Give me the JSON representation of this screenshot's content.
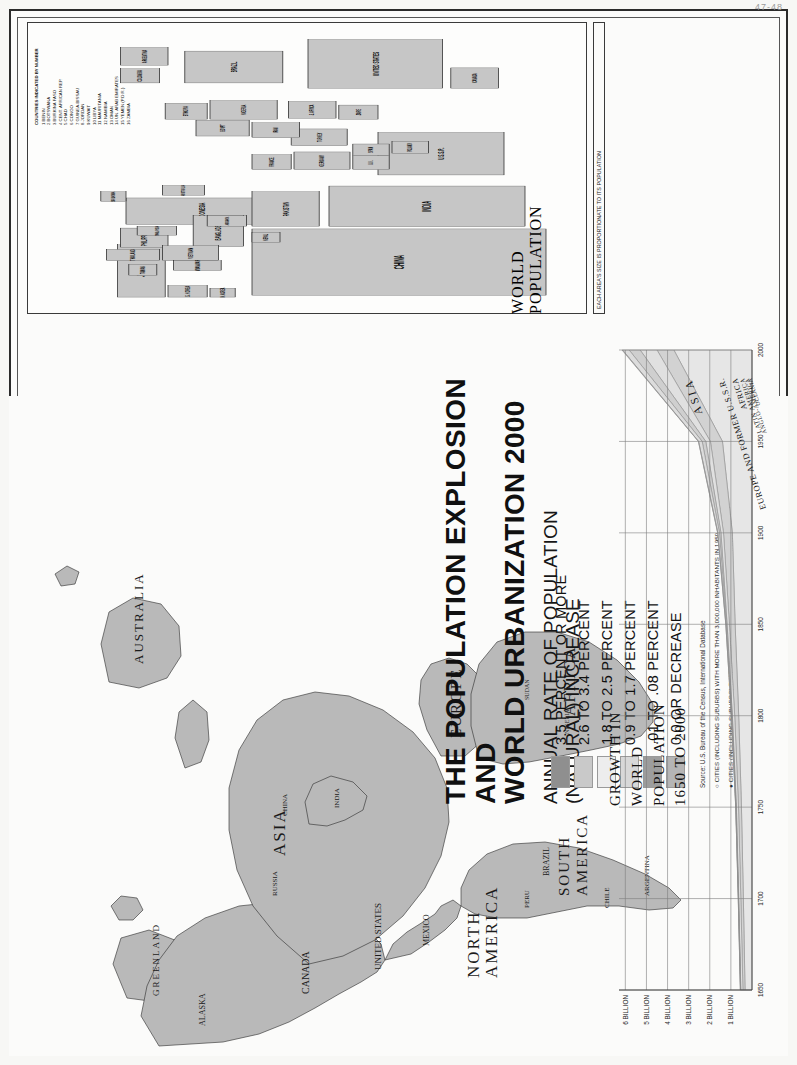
{
  "poster": {
    "title_line1": "THE POPULATION EXPLOSION AND",
    "title_line2": "WORLD URBANIZATION 2000",
    "subtitle_line1": "ANNUAL RATE OF POPULATION",
    "subtitle_line2": "(NATURAL) INCREASE",
    "corner_mark": "47-48"
  },
  "legend": {
    "items": [
      {
        "label": "3.5 PERCENT OR MORE",
        "color": "#8f8f8f"
      },
      {
        "label": "2.6 TO 3.4 PERCENT",
        "color": "#c9c9c9"
      },
      {
        "label": "1.8 TO 2.5 PERCENT",
        "color": "#ededed"
      },
      {
        "label": "0.9 TO 1.7 PERCENT",
        "color": "#d8d8d8"
      },
      {
        "label": ".01 TO .08 PERCENT",
        "color": "#9d9d9d"
      },
      {
        "label": "0.0 OR DECREASE",
        "color": "#b5b5b5"
      }
    ],
    "source": "Source: U.S. Bureau of the Census, International Database",
    "note_open_circle": "CITIES (INCLUDING SUBURBS) WITH MORE THAN 3,000,000 INHABITANTS IN 1950",
    "note_filled_dot": "CITIES (INCLUDING SUBURBS) THAT REACHED 3,000,000 OR MORE INHABITANTS SINCE 1950",
    "copyright": "© Copyright by HAMMOND INCORPORATED, Maplewood, N.J."
  },
  "cartogram": {
    "caption_line1": "WORLD",
    "caption_line2": "POPULATION",
    "key_note": "EACH AREA'S SIZE IS PROPORTIONATE TO ITS POPULATION",
    "numbered_heading": "COUNTRIES INDICATED BY NUMBER",
    "numbered": [
      "1 BENIN",
      "2 BOTSWANA",
      "3 BURKINA FASO",
      "4 CENT. AFRICAN REP.",
      "5 CHAD",
      "6 CONGO",
      "7 GUINEA-BISSAU",
      "8 JORDAN",
      "9 KUWAIT",
      "10 LIBYA",
      "11 MAURITANIA",
      "12 NAMIBIA",
      "13 OMAN",
      "14 UN. ARAB EMIRATES",
      "15 YEMEN (P.D.R.)",
      "16 ZAMBIA"
    ],
    "blocks": [
      {
        "name": "CHINA",
        "x": 40,
        "y": 160,
        "w": 150,
        "h": 210,
        "tone": "mid",
        "fs": 10
      },
      {
        "name": "INDIA",
        "x": 195,
        "y": 215,
        "w": 92,
        "h": 140,
        "tone": "mid",
        "fs": 9
      },
      {
        "name": "JAPAN",
        "x": 36,
        "y": 64,
        "w": 118,
        "h": 34,
        "tone": "mid",
        "fs": 8
      },
      {
        "name": "INDONESIA",
        "x": 200,
        "y": 70,
        "w": 60,
        "h": 108,
        "tone": "mid",
        "fs": 7
      },
      {
        "name": "PAKISTAN",
        "x": 196,
        "y": 160,
        "w": 78,
        "h": 48,
        "tone": "mid",
        "fs": 6.5
      },
      {
        "name": "BANGLADESH",
        "x": 150,
        "y": 118,
        "w": 70,
        "h": 36,
        "tone": "mid",
        "fs": 6
      },
      {
        "name": "PHILIPPINES",
        "x": 148,
        "y": 66,
        "w": 44,
        "h": 34,
        "tone": "mid",
        "fs": 6
      },
      {
        "name": "VIETNAM",
        "x": 118,
        "y": 96,
        "w": 34,
        "h": 40,
        "tone": "mid",
        "fs": 5.5
      },
      {
        "name": "THAILAND",
        "x": 118,
        "y": 56,
        "w": 26,
        "h": 38,
        "tone": "mid",
        "fs": 5
      },
      {
        "name": "MYANMAR",
        "x": 96,
        "y": 104,
        "w": 22,
        "h": 34,
        "tone": "mid",
        "fs": 5
      },
      {
        "name": "S. KOREA",
        "x": 36,
        "y": 100,
        "w": 26,
        "h": 28,
        "tone": "mid",
        "fs": 5
      },
      {
        "name": "N. KOREA",
        "x": 36,
        "y": 130,
        "w": 20,
        "h": 18,
        "tone": "mid",
        "fs": 4.5
      },
      {
        "name": "NEPAL",
        "x": 160,
        "y": 160,
        "w": 22,
        "h": 20,
        "tone": "mid",
        "fs": 4.5
      },
      {
        "name": "SRI LANKA",
        "x": 252,
        "y": 52,
        "w": 22,
        "h": 18,
        "tone": "mid",
        "fs": 4.2
      },
      {
        "name": "AFGHAN.",
        "x": 196,
        "y": 128,
        "w": 24,
        "h": 28,
        "tone": "mid",
        "fs": 4.2
      },
      {
        "name": "MALAYSIA",
        "x": 176,
        "y": 78,
        "w": 20,
        "h": 28,
        "tone": "mid",
        "fs": 4.2
      },
      {
        "name": "TAIWAN",
        "x": 84,
        "y": 72,
        "w": 26,
        "h": 20,
        "tone": "mid",
        "fs": 4.5
      },
      {
        "name": "U.S.S.R.",
        "x": 312,
        "y": 250,
        "w": 96,
        "h": 90,
        "tone": "mid",
        "fs": 7
      },
      {
        "name": "GERMANY",
        "x": 324,
        "y": 190,
        "w": 40,
        "h": 40,
        "tone": "mid",
        "fs": 5
      },
      {
        "name": "TURKEY",
        "x": 378,
        "y": 188,
        "w": 38,
        "h": 40,
        "tone": "mid",
        "fs": 5
      },
      {
        "name": "ITALY",
        "x": 366,
        "y": 190,
        "w": 0,
        "h": 0,
        "tone": "mid",
        "fs": 5
      },
      {
        "name": "IRAN",
        "x": 396,
        "y": 160,
        "w": 34,
        "h": 34,
        "tone": "mid",
        "fs": 5
      },
      {
        "name": "FRANCE",
        "x": 324,
        "y": 160,
        "w": 34,
        "h": 28,
        "tone": "mid",
        "fs": 5
      },
      {
        "name": "U.K.",
        "x": 324,
        "y": 232,
        "w": 32,
        "h": 26,
        "tone": "mid",
        "fs": 5
      },
      {
        "name": "SPAIN",
        "x": 356,
        "y": 232,
        "w": 26,
        "h": 26,
        "tone": "mid",
        "fs": 4.6
      },
      {
        "name": "POLAND",
        "x": 360,
        "y": 260,
        "w": 28,
        "h": 26,
        "tone": "mid",
        "fs": 4.6
      },
      {
        "name": "EGYPT",
        "x": 400,
        "y": 120,
        "w": 36,
        "h": 38,
        "tone": "mid",
        "fs": 5
      },
      {
        "name": "NIGERIA",
        "x": 438,
        "y": 130,
        "w": 42,
        "h": 48,
        "tone": "mid",
        "fs": 5.5
      },
      {
        "name": "S. AFRICA",
        "x": 440,
        "y": 186,
        "w": 38,
        "h": 34,
        "tone": "mid",
        "fs": 4.8
      },
      {
        "name": "ETHIOPIA",
        "x": 438,
        "y": 98,
        "w": 36,
        "h": 30,
        "tone": "mid",
        "fs": 4.8
      },
      {
        "name": "ZAIRE",
        "x": 438,
        "y": 222,
        "w": 32,
        "h": 28,
        "tone": "mid",
        "fs": 4.8
      },
      {
        "name": "UNITED STATES",
        "x": 508,
        "y": 200,
        "w": 110,
        "h": 96,
        "tone": "mid",
        "fs": 7
      },
      {
        "name": "BRAZIL",
        "x": 520,
        "y": 112,
        "w": 72,
        "h": 70,
        "tone": "mid",
        "fs": 6.5
      },
      {
        "name": "MEXICO",
        "x": 506,
        "y": 156,
        "w": 0,
        "h": 0,
        "tone": "mid",
        "fs": 5.5
      },
      {
        "name": "CANADA",
        "x": 508,
        "y": 302,
        "w": 46,
        "h": 34,
        "tone": "mid",
        "fs": 5
      },
      {
        "name": "ARGENTINA",
        "x": 560,
        "y": 66,
        "w": 40,
        "h": 34,
        "tone": "mid",
        "fs": 5
      },
      {
        "name": "COLOMBIA",
        "x": 520,
        "y": 66,
        "w": 32,
        "h": 28,
        "tone": "mid",
        "fs": 4.6
      },
      {
        "name": "AUSTRALIA",
        "x": 266,
        "y": 96,
        "w": 22,
        "h": 30,
        "tone": "mid",
        "fs": 4.4
      }
    ]
  },
  "growth_chart": {
    "title_line1": "GROWTH IN",
    "title_line2": "WORLD",
    "title_line3": "POPULATION",
    "title_line4": "1650 TO 2000"
  },
  "chart_data": {
    "type": "area",
    "title": "GROWTH IN WORLD POPULATION 1650 TO 2000",
    "xlabel": "",
    "ylabel": "",
    "x": [
      1650,
      1700,
      1750,
      1800,
      1850,
      1900,
      1950,
      2000
    ],
    "ytick_labels": [
      "1 BILLION",
      "2 BILLION",
      "3 BILLION",
      "4 BILLION",
      "5 BILLION",
      "6 BILLION"
    ],
    "ytick_values": [
      1,
      2,
      3,
      4,
      5,
      6
    ],
    "ylim": [
      0,
      6.3
    ],
    "xlim": [
      1650,
      2000
    ],
    "grid": true,
    "legend_position": "inline-band-labels",
    "units": "billions of people",
    "stacked": true,
    "series": [
      {
        "name": "ASIA",
        "values": [
          0.33,
          0.41,
          0.5,
          0.63,
          0.8,
          0.93,
          1.4,
          3.7
        ]
      },
      {
        "name": "EUROPE AND FORMER U.S.S.R.",
        "values": [
          0.1,
          0.12,
          0.14,
          0.19,
          0.27,
          0.42,
          0.57,
          0.8
        ]
      },
      {
        "name": "AFRICA",
        "values": [
          0.1,
          0.1,
          0.1,
          0.11,
          0.11,
          0.12,
          0.22,
          0.8
        ]
      },
      {
        "name": "LATIN AMERICA",
        "values": [
          0.01,
          0.01,
          0.02,
          0.02,
          0.03,
          0.07,
          0.17,
          0.52
        ]
      },
      {
        "name": "ANGLO-AMERICA",
        "values": [
          0.01,
          0.01,
          0.01,
          0.02,
          0.03,
          0.08,
          0.17,
          0.31
        ]
      },
      {
        "name": "OCEANIA",
        "values": [
          0.0,
          0.0,
          0.0,
          0.0,
          0.0,
          0.01,
          0.01,
          0.03
        ]
      }
    ],
    "totals": [
      0.55,
      0.65,
      0.77,
      0.97,
      1.24,
      1.63,
      2.54,
      6.16
    ]
  },
  "map": {
    "continents": [
      "NORTH AMERICA",
      "SOUTH AMERICA",
      "EUROPE",
      "AFRICA",
      "ASIA",
      "AUSTRALIA",
      "GREENLAND"
    ],
    "countries": [
      "ALASKA",
      "CANADA",
      "UNITED STATES",
      "MEXICO",
      "GULF OF",
      "BAHAMAS",
      "CUBA",
      "JAM.",
      "HAITI",
      "DOM. REP.",
      "NIC.",
      "PANAMA",
      "COLOMBIA",
      "VEN.",
      "GUYANA",
      "SURINAME",
      "FR. GUIANA",
      "ECUADOR",
      "PERU",
      "BOLIVIA",
      "BRAZIL",
      "PARAGUAY",
      "URUGUAY",
      "ARGENTINA",
      "CHILE",
      "ICELAND",
      "IRELAND",
      "UNITED KINGDOM",
      "FRANCE",
      "SPAIN",
      "PORTUGAL",
      "GER.",
      "POL.",
      "CZECH.",
      "AUS.",
      "HUNG.",
      "ITALY",
      "GREECE",
      "ROM.",
      "BUL.",
      "YUGO.",
      "UKRAINE",
      "BELARUS",
      "FINLAND",
      "SWEDEN",
      "NORWAY",
      "EST.",
      "LAT.",
      "LITH.",
      "MOLD.",
      "MOROCCO",
      "ALGERIA",
      "TUNISIA",
      "LIBYA",
      "EGYPT",
      "W. SAHARA",
      "MAURITANIA",
      "MALI",
      "NIGER",
      "CHAD",
      "SUDAN",
      "ERITREA",
      "ETHIOPIA",
      "SOMALIA",
      "DJIB.",
      "SEN.",
      "GAMBIA",
      "GUINEA",
      "S. LEONE",
      "LIBERIA",
      "CÔTE D'IVOIRE",
      "B. F.",
      "GHANA",
      "TOGO",
      "BENIN",
      "NIGERIA",
      "CAM.",
      "C. AF. REP.",
      "EQ. G.",
      "GABON",
      "CONGO",
      "DEM. REP. OF THE CONGO",
      "UGANDA",
      "KENYA",
      "RWANDA",
      "BURUNDI",
      "TANZANIA",
      "ANGOLA",
      "ZAMBIA",
      "MALAWI",
      "MOZ.",
      "ZIMB.",
      "BOTS.",
      "NAMIBIA",
      "SOUTH AFRICA",
      "LES.",
      "SWAZ.",
      "MADAGASCAR",
      "MAURITIUS",
      "TURKEY",
      "SYRIA",
      "IRAQ",
      "IRAN",
      "SAUDI ARABIA",
      "JORDAN",
      "ISRAEL",
      "LEB.",
      "KUWAIT",
      "U.A.E.",
      "OMAN",
      "YEMEN",
      "RUSSIA",
      "KAZAKHSTAN",
      "UZBEK.",
      "TURKM.",
      "TAJIK.",
      "KYRG.",
      "AFGHAN.",
      "PAKISTAN",
      "INDIA",
      "NEPAL",
      "BHUTAN",
      "BANGLADESH",
      "SRI LANKA",
      "MYAN.",
      "THAI.",
      "LAOS",
      "VIETNAM",
      "CAMBODIA",
      "MALAYSIA",
      "SINGAPORE",
      "INDONESIA",
      "E. TIMOR",
      "PHILIPPINES",
      "CHINA",
      "MONGOLIA",
      "N. KOREA",
      "SOUTH KOREA",
      "JAPAN",
      "TAIWAN",
      "AUSTRALIA",
      "NEW ZEALAND",
      "PAPUA NEW GUINEA",
      "SOLOMON IS.",
      "VANUATU",
      "FIJI"
    ],
    "cities": [
      "Seattle",
      "San Francisco",
      "Los Angeles",
      "Phoenix",
      "Denver",
      "Dallas",
      "Ft. Worth",
      "Houston",
      "Chicago",
      "Detroit",
      "Toronto",
      "Boston",
      "New York",
      "Philadelphia",
      "Washington",
      "Atlanta",
      "Miami",
      "Mexico City",
      "Lima",
      "Santiago",
      "Buenos Aires",
      "Rio de Janeiro",
      "São Paulo",
      "London",
      "Paris",
      "Madrid",
      "Milan",
      "Rome",
      "Berlin",
      "Moscow",
      "St. Petersburg",
      "Istanbul",
      "Cairo",
      "Alexandria",
      "Lagos",
      "Kinshasa",
      "Baghdad",
      "Tehran",
      "Karachi",
      "Delhi",
      "Lahore",
      "Mumbai (Bombay)",
      "Hyderabad",
      "Chennai (Madras)",
      "Kolkata (Calcutta)",
      "Dhaka",
      "Bangkok",
      "Ho Chi Minh City",
      "Manila",
      "Jakarta",
      "Singapore",
      "Beijing",
      "Tianjin",
      "Shenyang",
      "Shanghai",
      "Wuhan",
      "Guangzhou",
      "Hong Kong",
      "Seoul",
      "Pusan",
      "Tokyo",
      "Yokohama",
      "Osaka",
      "Sydney",
      "Melbourne"
    ],
    "oceans": [
      "PACIFIC OCEAN",
      "ATLANTIC OCEAN",
      "INDIAN OCEAN"
    ]
  }
}
